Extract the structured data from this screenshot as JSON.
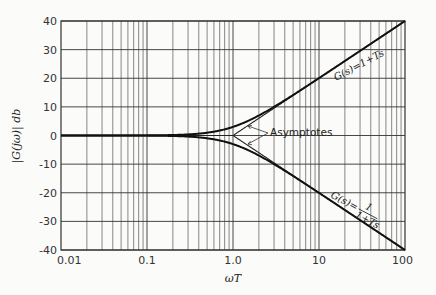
{
  "chart_data": {
    "type": "line",
    "title": "",
    "xlabel": "ωT",
    "ylabel": "|G(jω)|  db",
    "xscale": "log",
    "xlim": [
      0.01,
      100
    ],
    "ylim": [
      -40,
      40
    ],
    "grid": true,
    "x_tick_labels": [
      "0.01",
      "0.1",
      "1.0",
      "10",
      "100"
    ],
    "y_tick_labels": [
      "40",
      "30",
      "20",
      "10",
      "0",
      "-10",
      "-20",
      "-30",
      "-40"
    ],
    "y_ticks": [
      40,
      30,
      20,
      10,
      0,
      -10,
      -20,
      -30,
      -40
    ],
    "x": [
      0.01,
      0.1,
      0.3,
      0.5,
      1.0,
      2.0,
      3.0,
      10,
      30,
      100
    ],
    "series": [
      {
        "name": "G(s) = 1 + Ts",
        "values": [
          0.0,
          0.04,
          0.37,
          0.97,
          3.01,
          6.99,
          10.0,
          20.04,
          29.55,
          40.0
        ]
      },
      {
        "name": "G(s) = 1/(1 + Ts)",
        "values": [
          0.0,
          -0.04,
          -0.37,
          -0.97,
          -3.01,
          -6.99,
          -10.0,
          -20.04,
          -29.55,
          -40.0
        ]
      },
      {
        "name": "Asymptote (1 + Ts)",
        "values": [
          0,
          0,
          0,
          0,
          0,
          6.02,
          9.54,
          20,
          29.54,
          40
        ]
      },
      {
        "name": "Asymptote 1/(1 + Ts)",
        "values": [
          0,
          0,
          0,
          0,
          0,
          -6.02,
          -9.54,
          -20,
          -29.54,
          -40
        ]
      }
    ],
    "annotations": [
      {
        "text": "G(s)=1+Ts",
        "near_x": 20,
        "near_y": 20
      },
      {
        "text": "G(s)=1/(1+Ts)",
        "near_x": 20,
        "near_y": -22
      },
      {
        "text": "Asymptotes",
        "near_x": 3,
        "near_y": 0
      }
    ]
  },
  "labels": {
    "ylabel": "|G(jω)|  db",
    "xlabel": "ωT",
    "curve_up": "G(s)=1+Ts",
    "curve_down_lhs": "G(s)=",
    "curve_down_num": "1",
    "curve_down_den": "1+Ts",
    "asymptotes": "Asymptotes"
  }
}
